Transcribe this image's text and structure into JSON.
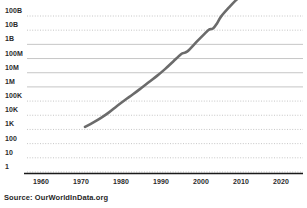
{
  "source_note": "Source: OurWorldInData.org",
  "chart_data": {
    "type": "line",
    "title": "",
    "subtitle": "",
    "xlabel": "",
    "ylabel": "",
    "yscale": "log",
    "xlim": [
      1955,
      2023
    ],
    "ylim": [
      1,
      100000000000
    ],
    "grid": true,
    "legend_position": "none",
    "line_color": "#6b6b6b",
    "axis_color": "#1a1a1a",
    "gridline_color": "#b8b8b8",
    "y_ticks": [
      {
        "label": "100B",
        "value": 100000000000
      },
      {
        "label": "10B",
        "value": 10000000000
      },
      {
        "label": "1B",
        "value": 1000000000
      },
      {
        "label": "100M",
        "value": 100000000
      },
      {
        "label": "10M",
        "value": 10000000
      },
      {
        "label": "1M",
        "value": 1000000
      },
      {
        "label": "100K",
        "value": 100000
      },
      {
        "label": "10K",
        "value": 10000
      },
      {
        "label": "1K",
        "value": 1000
      },
      {
        "label": "100",
        "value": 100
      },
      {
        "label": "10",
        "value": 10
      },
      {
        "label": "1",
        "value": 1
      }
    ],
    "x_ticks": [
      {
        "label": "1960",
        "value": 1960
      },
      {
        "label": "1970",
        "value": 1970
      },
      {
        "label": "1980",
        "value": 1980
      },
      {
        "label": "1990",
        "value": 1990
      },
      {
        "label": "2000",
        "value": 2000
      },
      {
        "label": "2010",
        "value": 2010
      },
      {
        "label": "2020",
        "value": 2020
      }
    ],
    "series": [
      {
        "name": "growth",
        "x": [
          1971,
          1973,
          1975,
          1977,
          1979,
          1981,
          1983,
          1985,
          1987,
          1989,
          1991,
          1993,
          1995,
          1996,
          1997,
          1999,
          2001,
          2002,
          2003,
          2004,
          2005,
          2007,
          2009,
          2011,
          2013,
          2015,
          2017
        ],
        "y": [
          1500,
          3000,
          6500,
          16000,
          45000,
          120000,
          300000,
          800000,
          2200000,
          6000000,
          18000000,
          60000000,
          200000000,
          260000000,
          400000000,
          1600000000,
          6000000000,
          11000000000,
          13000000000,
          30000000000,
          90000000000,
          400000000000,
          1500000000000,
          4000000000000,
          10000000000000,
          22000000000000,
          40000000000000
        ]
      }
    ]
  }
}
